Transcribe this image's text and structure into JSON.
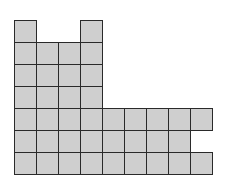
{
  "diagram": {
    "type": "unit-square grid figure",
    "origin": {
      "x": 14,
      "y": 20
    },
    "cell_size": 22,
    "fill_color": "#cfcfcf",
    "border_color": "#2a2a2a",
    "rows": [
      {
        "row": 0,
        "cols": [
          0,
          3
        ]
      },
      {
        "row": 1,
        "cols": [
          0,
          1,
          2,
          3
        ]
      },
      {
        "row": 2,
        "cols": [
          0,
          1,
          2,
          3
        ]
      },
      {
        "row": 3,
        "cols": [
          0,
          1,
          2,
          3
        ]
      },
      {
        "row": 4,
        "cols": [
          0,
          1,
          2,
          3,
          4,
          5,
          6,
          7,
          8
        ]
      },
      {
        "row": 5,
        "cols": [
          0,
          1,
          2,
          3,
          4,
          5,
          6,
          7
        ]
      },
      {
        "row": 6,
        "cols": [
          0,
          1,
          2,
          3,
          4,
          5,
          6,
          7,
          8
        ]
      }
    ],
    "total_squares": 39
  }
}
